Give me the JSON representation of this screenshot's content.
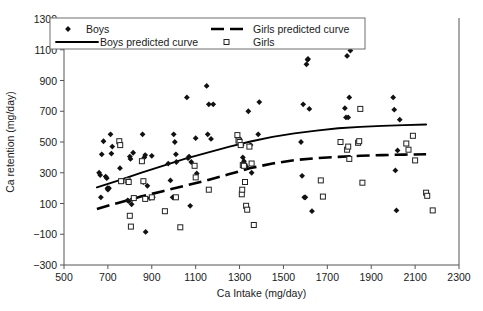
{
  "chart_data": {
    "type": "scatter",
    "title": "",
    "xlabel": "Ca Intake (mg/day)",
    "ylabel": "Ca retention (mg/day)",
    "xlim": [
      500,
      2300
    ],
    "ylim": [
      -300,
      1300
    ],
    "xticks": [
      500,
      700,
      900,
      1100,
      1300,
      1500,
      1700,
      1900,
      2100,
      2300
    ],
    "yticks": [
      -300,
      -100,
      100,
      300,
      500,
      700,
      900,
      1100,
      1300
    ],
    "grid": false,
    "legend_position": "top",
    "legend": [
      {
        "label": "Boys",
        "marker": "filled-diamond",
        "color": "#111111"
      },
      {
        "label": "Girls predicted curve",
        "marker": "dashed-line",
        "color": "#000000"
      },
      {
        "label": "Boys predicted curve",
        "marker": "solid-line",
        "color": "#000000"
      },
      {
        "label": "Girls",
        "marker": "open-square",
        "color": "#222222"
      }
    ],
    "series": [
      {
        "name": "Boys",
        "marker": "filled-diamond",
        "points": [
          [
            660,
            300
          ],
          [
            665,
            285
          ],
          [
            668,
            140
          ],
          [
            672,
            420
          ],
          [
            680,
            505
          ],
          [
            690,
            275
          ],
          [
            695,
            265
          ],
          [
            698,
            200
          ],
          [
            700,
            190
          ],
          [
            705,
            200
          ],
          [
            712,
            550
          ],
          [
            716,
            425
          ],
          [
            720,
            470
          ],
          [
            755,
            330
          ],
          [
            790,
            120
          ],
          [
            795,
            115
          ],
          [
            800,
            405
          ],
          [
            803,
            390
          ],
          [
            808,
            95
          ],
          [
            812,
            130
          ],
          [
            815,
            430
          ],
          [
            858,
            550
          ],
          [
            862,
            240
          ],
          [
            866,
            400
          ],
          [
            870,
            415
          ],
          [
            872,
            -85
          ],
          [
            880,
            215
          ],
          [
            892,
            135
          ],
          [
            900,
            410
          ],
          [
            905,
            140
          ],
          [
            975,
            360
          ],
          [
            985,
            250
          ],
          [
            995,
            140
          ],
          [
            1000,
            550
          ],
          [
            1005,
            500
          ],
          [
            1010,
            420
          ],
          [
            1012,
            370
          ],
          [
            1060,
            790
          ],
          [
            1065,
            395
          ],
          [
            1070,
            405
          ],
          [
            1075,
            85
          ],
          [
            1080,
            370
          ],
          [
            1100,
            525
          ],
          [
            1105,
            295
          ],
          [
            1150,
            865
          ],
          [
            1155,
            550
          ],
          [
            1160,
            745
          ],
          [
            1170,
            520
          ],
          [
            1180,
            745
          ],
          [
            1300,
            520
          ],
          [
            1310,
            480
          ],
          [
            1315,
            400
          ],
          [
            1320,
            375
          ],
          [
            1325,
            355
          ],
          [
            1330,
            340
          ],
          [
            1340,
            700
          ],
          [
            1350,
            480
          ],
          [
            1355,
            300
          ],
          [
            1385,
            550
          ],
          [
            1390,
            760
          ],
          [
            1580,
            500
          ],
          [
            1585,
            280
          ],
          [
            1590,
            745
          ],
          [
            1595,
            140
          ],
          [
            1600,
            140
          ],
          [
            1605,
            1005
          ],
          [
            1610,
            1035
          ],
          [
            1612,
            1040
          ],
          [
            1618,
            715
          ],
          [
            1630,
            50
          ],
          [
            1780,
            720
          ],
          [
            1785,
            660
          ],
          [
            1790,
            1060
          ],
          [
            1795,
            660
          ],
          [
            1800,
            790
          ],
          [
            1805,
            1095
          ],
          [
            2000,
            790
          ],
          [
            2005,
            710
          ],
          [
            2010,
            315
          ],
          [
            2015,
            55
          ],
          [
            2020,
            445
          ],
          [
            2030,
            645
          ]
        ]
      },
      {
        "name": "Girls",
        "marker": "open-square",
        "points": [
          [
            752,
            505
          ],
          [
            756,
            480
          ],
          [
            760,
            245
          ],
          [
            790,
            250
          ],
          [
            795,
            240
          ],
          [
            800,
            20
          ],
          [
            805,
            -50
          ],
          [
            818,
            135
          ],
          [
            855,
            375
          ],
          [
            862,
            245
          ],
          [
            870,
            130
          ],
          [
            900,
            140
          ],
          [
            960,
            50
          ],
          [
            1010,
            140
          ],
          [
            1030,
            -55
          ],
          [
            1095,
            345
          ],
          [
            1100,
            270
          ],
          [
            1160,
            190
          ],
          [
            1290,
            545
          ],
          [
            1295,
            510
          ],
          [
            1300,
            500
          ],
          [
            1305,
            480
          ],
          [
            1310,
            160
          ],
          [
            1312,
            190
          ],
          [
            1315,
            350
          ],
          [
            1320,
            345
          ],
          [
            1325,
            240
          ],
          [
            1330,
            85
          ],
          [
            1335,
            60
          ],
          [
            1345,
            470
          ],
          [
            1355,
            360
          ],
          [
            1365,
            -40
          ],
          [
            1670,
            250
          ],
          [
            1680,
            145
          ],
          [
            1760,
            500
          ],
          [
            1790,
            450
          ],
          [
            1795,
            470
          ],
          [
            1800,
            390
          ],
          [
            1840,
            495
          ],
          [
            1845,
            505
          ],
          [
            1850,
            715
          ],
          [
            1860,
            235
          ],
          [
            2060,
            490
          ],
          [
            2070,
            450
          ],
          [
            2090,
            540
          ],
          [
            2100,
            380
          ],
          [
            2150,
            170
          ],
          [
            2155,
            150
          ],
          [
            2180,
            55
          ]
        ]
      }
    ],
    "curves": [
      {
        "name": "Boys predicted curve",
        "style": "solid",
        "points": [
          [
            650,
            205
          ],
          [
            750,
            250
          ],
          [
            850,
            300
          ],
          [
            950,
            345
          ],
          [
            1050,
            390
          ],
          [
            1150,
            430
          ],
          [
            1250,
            468
          ],
          [
            1350,
            503
          ],
          [
            1450,
            533
          ],
          [
            1550,
            556
          ],
          [
            1650,
            574
          ],
          [
            1750,
            589
          ],
          [
            1850,
            598
          ],
          [
            1950,
            605
          ],
          [
            2050,
            610
          ],
          [
            2150,
            614
          ]
        ]
      },
      {
        "name": "Girls predicted curve",
        "style": "dashed",
        "points": [
          [
            650,
            65
          ],
          [
            750,
            105
          ],
          [
            850,
            145
          ],
          [
            950,
            180
          ],
          [
            1050,
            215
          ],
          [
            1150,
            250
          ],
          [
            1250,
            290
          ],
          [
            1350,
            330
          ],
          [
            1450,
            360
          ],
          [
            1550,
            382
          ],
          [
            1650,
            395
          ],
          [
            1750,
            403
          ],
          [
            1850,
            410
          ],
          [
            1950,
            415
          ],
          [
            2050,
            418
          ],
          [
            2150,
            420
          ]
        ]
      }
    ]
  }
}
